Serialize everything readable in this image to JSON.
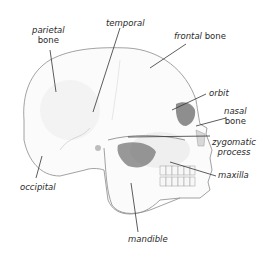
{
  "diagram": {
    "colors": {
      "outline": "#8a8a8a",
      "shade": "#5a5a5a",
      "label": "#2a2a2a",
      "leader": "#333333",
      "background": "#ffffff"
    },
    "labels": {
      "parietal": {
        "line1": "parietal",
        "line2": "bone"
      },
      "temporal": {
        "line1": "temporal"
      },
      "frontal": {
        "italic": "frontal",
        "plain": " bone"
      },
      "orbit": {
        "line1": "orbit"
      },
      "nasal": {
        "line1": "nasal",
        "line2": "bone"
      },
      "zygomatic": {
        "line1": "zygomatic",
        "line2": "process"
      },
      "maxilla": {
        "line1": "maxilla"
      },
      "occipital": {
        "line1": "occipital"
      },
      "mandible": {
        "line1": "mandible"
      }
    }
  }
}
